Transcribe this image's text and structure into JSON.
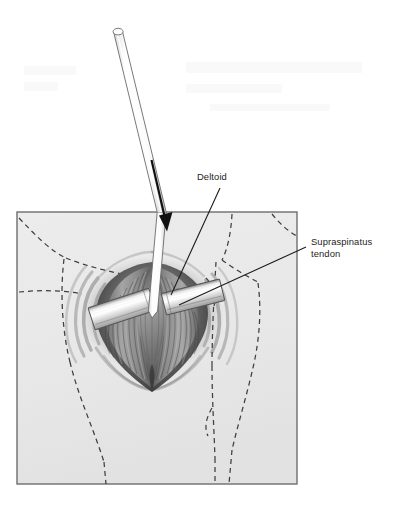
{
  "figure": {
    "kind": "surgical-anatomy-illustration",
    "background_color": "#ffffff",
    "ink_color": "#1d1d1d"
  },
  "labels": [
    {
      "id": "deltoid",
      "text": "Deltoid",
      "lines": [
        "Deltoid"
      ],
      "text_x": 197,
      "text_y": 180,
      "anchor": "start",
      "leader": {
        "x1": 220,
        "y1": 188,
        "x2": 171,
        "y2": 295
      }
    },
    {
      "id": "supraspinatus-tendon",
      "text": "Supraspinatus tendon",
      "lines": [
        "Supraspinatus",
        "tendon"
      ],
      "text_x": 311,
      "text_y": 245,
      "anchor": "start",
      "leader": {
        "x1": 306,
        "y1": 247,
        "x2": 179,
        "y2": 305
      }
    }
  ],
  "skin_field": {
    "name": "skin-surface-panel",
    "x": 17,
    "y": 212,
    "width": 280,
    "height": 272,
    "fill": "#e9e9e9",
    "stroke": "#6e6e6e"
  },
  "instruments": {
    "cannula": {
      "name": "cannula-tube",
      "tip_x": 162,
      "tip_y": 318,
      "top_x": 118,
      "top_y": 28,
      "width": 9,
      "fill": "#fdfdfd",
      "stroke": "#6a6a6a"
    },
    "arrow": {
      "name": "insertion-direction-arrow",
      "x1": 152,
      "y1": 160,
      "x2": 167,
      "y2": 228,
      "color": "#111111"
    },
    "retractors": [
      {
        "name": "retractor-blade-left",
        "cx": 122,
        "cy": 309,
        "angle": -18
      },
      {
        "name": "retractor-blade-right",
        "cx": 193,
        "cy": 297,
        "angle": -14
      }
    ]
  },
  "wound": {
    "name": "deltoid-split-wound",
    "center_x": 152,
    "center_y": 312,
    "top_y": 268,
    "bottom_y": 366
  },
  "colors": {
    "page": "#ffffff",
    "panel_fill": "#e9e9e9",
    "panel_stroke": "#6e6e6e",
    "dash_line": "#3f3f3f",
    "tissue_dark": "#4a4a4a",
    "tissue_mid": "#8d8d8d",
    "tissue_light": "#cfcfcf",
    "metal_light": "#fbfbfb",
    "metal_shadow": "#9a9a9a",
    "label_text": "#1d1d1d"
  }
}
